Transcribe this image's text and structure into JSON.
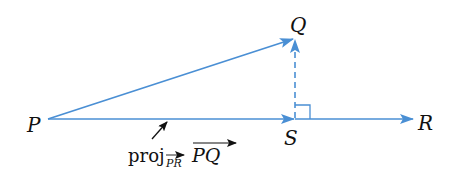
{
  "diagram": {
    "colors": {
      "vector": "#4a8fd4",
      "text": "#111111",
      "pointer": "#111111",
      "background": "#ffffff"
    },
    "points": {
      "P": {
        "label": "P",
        "x": 48,
        "y": 119
      },
      "Q": {
        "label": "Q",
        "x": 295,
        "y": 38
      },
      "S": {
        "label": "S",
        "x": 295,
        "y": 119
      },
      "R": {
        "label": "R",
        "x": 413,
        "y": 119
      }
    },
    "vectors": [
      {
        "name": "PQ",
        "from": "P",
        "to": "Q",
        "style": "solid"
      },
      {
        "name": "PS",
        "from": "P",
        "to": "S",
        "style": "solid"
      },
      {
        "name": "SR",
        "from": "S",
        "to": "R",
        "style": "solid"
      },
      {
        "name": "SQ",
        "from": "S",
        "to": "Q",
        "style": "dashed"
      }
    ],
    "right_angle_marker": {
      "at": "S",
      "size": 14
    },
    "annotation": {
      "prefix": "proj",
      "subscript": "PR",
      "vector": "PQ",
      "full_text": "proj_PR PQ"
    }
  }
}
